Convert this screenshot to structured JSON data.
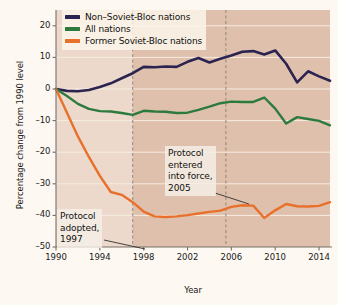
{
  "chart_data": {
    "type": "line",
    "title": "",
    "xlabel": "Year",
    "ylabel": "Percentage change from 1990 level",
    "xlim": [
      1990,
      2015
    ],
    "ylim": [
      -50,
      25
    ],
    "grid": true,
    "legend_position": "top-left",
    "xticks": [
      "1990",
      "1994",
      "1998",
      "2002",
      "2006",
      "2010",
      "2014"
    ],
    "xtick_values": [
      1990,
      1994,
      1998,
      2002,
      2006,
      2010,
      2014
    ],
    "yticks": [
      "20",
      "10",
      "0",
      "–10",
      "–20",
      "–30",
      "–40",
      "–50"
    ],
    "ytick_values": [
      20,
      10,
      0,
      -10,
      -20,
      -30,
      -40,
      -50
    ],
    "x": [
      1990,
      1991,
      1992,
      1993,
      1994,
      1995,
      1996,
      1997,
      1998,
      1999,
      2000,
      2001,
      2002,
      2003,
      2004,
      2005,
      2006,
      2007,
      2008,
      2009,
      2010,
      2011,
      2012,
      2013,
      2014,
      2015
    ],
    "series": [
      {
        "name": "Non–Soviet-Bloc nations",
        "color": "#2b2450",
        "values": [
          0,
          -0.6,
          -0.7,
          -0.3,
          0.6,
          1.8,
          3.4,
          5.0,
          7.0,
          6.9,
          7.1,
          7.0,
          8.6,
          9.8,
          8.4,
          9.6,
          10.6,
          11.8,
          12.0,
          10.9,
          12.2,
          8.0,
          2.1,
          5.6,
          4.0,
          2.6
        ]
      },
      {
        "name": "All nations",
        "color": "#2d7a3e",
        "values": [
          0,
          -2.2,
          -4.7,
          -6.3,
          -7.0,
          -7.1,
          -7.6,
          -8.2,
          -6.9,
          -7.1,
          -7.2,
          -7.6,
          -7.5,
          -6.6,
          -5.6,
          -4.5,
          -4.0,
          -4.1,
          -4.1,
          -2.7,
          -6.2,
          -10.9,
          -8.9,
          -9.5,
          -10.1,
          -11.5
        ]
      },
      {
        "name": "Former Soviet-Bloc nations",
        "color": "#e8702a",
        "values": [
          0,
          -7.5,
          -15.0,
          -21.5,
          -27.5,
          -32.6,
          -33.5,
          -35.8,
          -38.8,
          -40.3,
          -40.5,
          -40.3,
          -39.9,
          -39.4,
          -38.9,
          -38.5,
          -37.3,
          -36.8,
          -36.9,
          -40.8,
          -38.4,
          -36.4,
          -37.1,
          -37.2,
          -37.0,
          -35.8
        ]
      }
    ],
    "annotations": [
      {
        "name": "protocol-entered-into-force",
        "text": "Protocol\nentered\ninto force,\n2005",
        "marker_year": 2005.5
      },
      {
        "name": "protocol-adopted",
        "text": "Protocol\nadopted,\n1997",
        "marker_year": 1997
      }
    ],
    "vertical_markers": [
      {
        "name": "marker-1997",
        "year": 1997
      },
      {
        "name": "marker-2005",
        "year": 2005.5
      }
    ],
    "colors": {
      "plot_background": "#dfc0ac",
      "plot_background_early": "#ecd9cb",
      "page_background": "#fdf8f1",
      "gridline": "#f6ece2",
      "axis": "#7a7068",
      "marker_line": "#8a7f74"
    }
  }
}
